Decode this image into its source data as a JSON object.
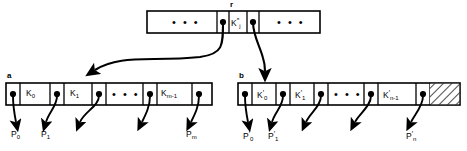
{
  "figure": {
    "title_label": "r",
    "root_node": {
      "name": "r",
      "left_ellipsis": "• • •",
      "right_ellipsis": "• • •",
      "key_base": "K",
      "key_sub": "j",
      "key_sup": "″",
      "key_text": "K″j"
    },
    "left_node": {
      "name": "a",
      "ellipsis": "• • •",
      "keys": [
        {
          "base": "K",
          "sub": "0",
          "sup": ""
        },
        {
          "base": "K",
          "sub": "1",
          "sup": ""
        },
        {
          "base": "K",
          "sub": "m-1",
          "sup": ""
        }
      ],
      "pointer_labels": [
        {
          "base": "P",
          "sub": "0",
          "sup": ""
        },
        {
          "base": "P",
          "sub": "1",
          "sup": ""
        },
        {
          "base": "P",
          "sub": "m",
          "sup": ""
        }
      ]
    },
    "right_node": {
      "name": "b",
      "ellipsis": "• • •",
      "has_hatched_free_space": true,
      "keys": [
        {
          "base": "K",
          "sub": "0",
          "sup": "′"
        },
        {
          "base": "K",
          "sub": "1",
          "sup": "′"
        },
        {
          "base": "K",
          "sub": "n-1",
          "sup": "′"
        }
      ],
      "pointer_labels": [
        {
          "base": "P",
          "sub": "0",
          "sup": "′"
        },
        {
          "base": "P",
          "sub": "1",
          "sup": "′"
        },
        {
          "base": "P",
          "sub": "n",
          "sup": "′"
        }
      ]
    },
    "colors": {
      "stroke": "#000000",
      "background": "#ffffff",
      "hatch": "#000000"
    }
  }
}
